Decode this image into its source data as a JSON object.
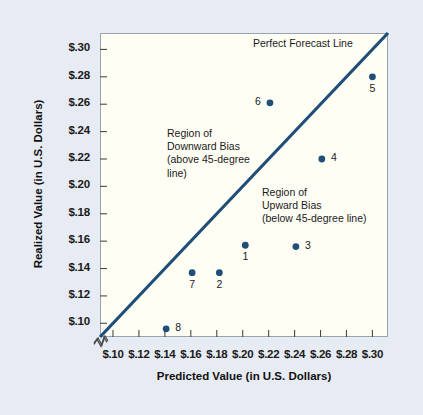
{
  "chart_data": {
    "type": "scatter",
    "title": "",
    "xlabel": "Predicted Value (in U.S. Dollars)",
    "ylabel": "Realized Value (in U.S. Dollars)",
    "xlim": [
      0.09,
      0.312
    ],
    "ylim": [
      0.09,
      0.312
    ],
    "xticks": [
      0.1,
      0.12,
      0.14,
      0.16,
      0.18,
      0.2,
      0.22,
      0.24,
      0.26,
      0.28,
      0.3
    ],
    "yticks": [
      0.1,
      0.12,
      0.14,
      0.16,
      0.18,
      0.2,
      0.22,
      0.24,
      0.26,
      0.28,
      0.3
    ],
    "xtick_labels": [
      "$.10",
      "$.12",
      "$.14",
      "$.16",
      "$.18",
      "$.20",
      "$.22",
      "$.24",
      "$.26",
      "$.28",
      "$.30"
    ],
    "ytick_labels": [
      "$.10",
      "$.12",
      "$.14",
      "$.16",
      "$.18",
      "$.20",
      "$.22",
      "$.24",
      "$.26",
      "$.28",
      "$.30"
    ],
    "grid": false,
    "legend": "none",
    "axis_break": true,
    "marker_color": "#1f4e79",
    "line_color": "#1f4e79",
    "plot_background": "#fffef5",
    "figure_background": "#e7ebf3",
    "points": [
      {
        "label": "1",
        "x": 0.202,
        "y": 0.157,
        "label_pos": "below"
      },
      {
        "label": "2",
        "x": 0.182,
        "y": 0.137,
        "label_pos": "below"
      },
      {
        "label": "3",
        "x": 0.241,
        "y": 0.156,
        "label_pos": "right"
      },
      {
        "label": "4",
        "x": 0.261,
        "y": 0.22,
        "label_pos": "right"
      },
      {
        "label": "5",
        "x": 0.3,
        "y": 0.28,
        "label_pos": "below"
      },
      {
        "label": "6",
        "x": 0.221,
        "y": 0.261,
        "label_pos": "left"
      },
      {
        "label": "7",
        "x": 0.161,
        "y": 0.137,
        "label_pos": "below"
      },
      {
        "label": "8",
        "x": 0.141,
        "y": 0.096,
        "label_pos": "right"
      }
    ],
    "reference_line": {
      "name": "Perfect Forecast Line",
      "kind": "identity-45-degree",
      "from": [
        0.09,
        0.09
      ],
      "to": [
        0.312,
        0.312
      ]
    },
    "annotations": [
      {
        "name": "downward-bias-region",
        "text": "Region of\nDownward Bias\n(above 45-degree\nline)"
      },
      {
        "name": "upward-bias-region",
        "text": "Region of\nUpward Bias\n(below 45-degree line)"
      },
      {
        "name": "perfect-forecast-line-label",
        "text": "Perfect Forecast Line"
      }
    ]
  }
}
